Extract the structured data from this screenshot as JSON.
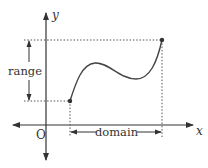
{
  "diagram": {
    "axes": {
      "x_label": "x",
      "y_label": "y",
      "origin_label": "O"
    },
    "annotations": {
      "range_label": "range",
      "domain_label": "domain"
    },
    "curve": {
      "start_point": "closed dot at left end",
      "end_point": "closed dot at right end"
    },
    "colors": {
      "ink": "#333333",
      "guide": "#555555",
      "background": "#ffffff"
    }
  }
}
